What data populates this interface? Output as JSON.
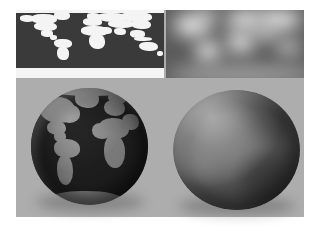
{
  "figure": {
    "background_color": "#ffffff",
    "plate_color": "#adadad",
    "panel_count": 4
  },
  "panels": [
    {
      "id": "world-map-texture",
      "position": "top-left",
      "label": "Sharp equirectangular world map texture",
      "ocean_color": "#3a3a3a",
      "land_color": "#f4f4f4",
      "projection": "equirectangular",
      "detail": "sharp"
    },
    {
      "id": "blurred-map-texture",
      "position": "top-right",
      "label": "Low-pass filtered (blurred) world map texture",
      "base_color": "#5b5b5b",
      "highlight_color": "#f2f2f2",
      "detail": "blurred"
    },
    {
      "id": "textured-globe",
      "position": "bottom-left",
      "label": "Sphere rendered with sharp map texture",
      "ocean_color": "#3a3a3a",
      "land_color": "#f2f2f2",
      "visible_region": "Americas, Atlantic Ocean, Africa, Europe"
    },
    {
      "id": "smooth-shaded-sphere",
      "position": "bottom-right",
      "label": "Sphere rendered with blurred map texture",
      "base_color": "#8f8f8f",
      "shading": "diffuse with upper-left light"
    }
  ],
  "map_geometry": {
    "landmasses": [
      {
        "name": "greenland",
        "x": 25.5,
        "y": 2,
        "w": 11,
        "h": 13
      },
      {
        "name": "arctic-ice-cap",
        "x": 0,
        "y": 0,
        "w": 100,
        "h": 4.5
      },
      {
        "name": "alaska",
        "x": 2.5,
        "y": 8,
        "w": 10,
        "h": 9
      },
      {
        "name": "canada",
        "x": 10,
        "y": 6,
        "w": 18,
        "h": 15
      },
      {
        "name": "north-america",
        "x": 12,
        "y": 17,
        "w": 16,
        "h": 14
      },
      {
        "name": "mexico",
        "x": 17,
        "y": 30,
        "w": 8,
        "h": 9
      },
      {
        "name": "central-america",
        "x": 23,
        "y": 37,
        "w": 5,
        "h": 7
      },
      {
        "name": "south-america-n",
        "x": 26,
        "y": 43,
        "w": 12,
        "h": 13
      },
      {
        "name": "south-america-s",
        "x": 28,
        "y": 54,
        "w": 7.5,
        "h": 20
      },
      {
        "name": "scandinavia",
        "x": 48,
        "y": 5,
        "w": 9,
        "h": 9
      },
      {
        "name": "europe",
        "x": 45,
        "y": 12,
        "w": 13,
        "h": 11
      },
      {
        "name": "africa-north",
        "x": 44,
        "y": 24,
        "w": 18,
        "h": 14
      },
      {
        "name": "africa-south",
        "x": 49,
        "y": 36,
        "w": 11,
        "h": 22
      },
      {
        "name": "arabia",
        "x": 57,
        "y": 25,
        "w": 8,
        "h": 11
      },
      {
        "name": "russia-west",
        "x": 55,
        "y": 4,
        "w": 20,
        "h": 14
      },
      {
        "name": "siberia",
        "x": 70,
        "y": 3,
        "w": 22,
        "h": 15
      },
      {
        "name": "central-asia",
        "x": 62,
        "y": 15,
        "w": 18,
        "h": 12
      },
      {
        "name": "india",
        "x": 66,
        "y": 26,
        "w": 8,
        "h": 11
      },
      {
        "name": "east-asia",
        "x": 78,
        "y": 14,
        "w": 13,
        "h": 14
      },
      {
        "name": "southeast-asia",
        "x": 77,
        "y": 30,
        "w": 10,
        "h": 11
      },
      {
        "name": "indonesia",
        "x": 80,
        "y": 40,
        "w": 12,
        "h": 6
      },
      {
        "name": "australia",
        "x": 83,
        "y": 47,
        "w": 13,
        "h": 14
      },
      {
        "name": "new-zealand",
        "x": 95,
        "y": 60,
        "w": 4,
        "h": 7
      },
      {
        "name": "antarctica",
        "x": 0,
        "y": 86,
        "w": 100,
        "h": 14
      }
    ]
  },
  "blur_blobs": [
    {
      "name": "arctic-band",
      "x": 0,
      "y": -6,
      "w": 110,
      "h": 20,
      "color": "#6e6e6e"
    },
    {
      "name": "north-america",
      "x": 6,
      "y": 8,
      "w": 26,
      "h": 30,
      "color": "#efefef"
    },
    {
      "name": "greenland",
      "x": 22,
      "y": 2,
      "w": 14,
      "h": 16,
      "color": "#e2e2e2"
    },
    {
      "name": "south-america",
      "x": 22,
      "y": 46,
      "w": 17,
      "h": 30,
      "color": "#f0f0f0"
    },
    {
      "name": "eurasia-west",
      "x": 44,
      "y": 2,
      "w": 26,
      "h": 26,
      "color": "#ededed"
    },
    {
      "name": "eurasia-east",
      "x": 66,
      "y": 2,
      "w": 32,
      "h": 26,
      "color": "#f4f4f4"
    },
    {
      "name": "africa",
      "x": 44,
      "y": 30,
      "w": 20,
      "h": 34,
      "color": "#dedede"
    },
    {
      "name": "india-asia",
      "x": 62,
      "y": 22,
      "w": 20,
      "h": 22,
      "color": "#c9c9c9"
    },
    {
      "name": "australia",
      "x": 80,
      "y": 44,
      "w": 18,
      "h": 22,
      "color": "#cfcfcf"
    },
    {
      "name": "antarctic-band",
      "x": 0,
      "y": 82,
      "w": 110,
      "h": 26,
      "color": "#a8a8a8"
    }
  ],
  "sphere_blobs": [
    {
      "name": "highlight-upper-left",
      "x": 8,
      "y": 6,
      "w": 50,
      "h": 46,
      "color": "#f0f0f0"
    },
    {
      "name": "highlight-left",
      "x": -4,
      "y": 40,
      "w": 44,
      "h": 40,
      "color": "#e8e8e8"
    },
    {
      "name": "mid-band",
      "x": 30,
      "y": 30,
      "w": 50,
      "h": 44,
      "color": "#c4c4c4"
    },
    {
      "name": "dark-lower-right",
      "x": 52,
      "y": 52,
      "w": 56,
      "h": 54,
      "color": "#6a6a6a"
    },
    {
      "name": "dark-upper-right",
      "x": 62,
      "y": 0,
      "w": 46,
      "h": 38,
      "color": "#7a7a7a"
    }
  ],
  "globe_geometry": {
    "landmasses": [
      {
        "name": "greenland",
        "x": 38,
        "y": 2,
        "w": 20,
        "h": 15
      },
      {
        "name": "arctic-cap",
        "x": 10,
        "y": -4,
        "w": 80,
        "h": 11
      },
      {
        "name": "north-america",
        "x": 8,
        "y": 8,
        "w": 30,
        "h": 22
      },
      {
        "name": "north-america-east",
        "x": 22,
        "y": 14,
        "w": 20,
        "h": 16
      },
      {
        "name": "mexico",
        "x": 14,
        "y": 28,
        "w": 16,
        "h": 12
      },
      {
        "name": "central-america",
        "x": 20,
        "y": 37,
        "w": 10,
        "h": 9
      },
      {
        "name": "south-america-n",
        "x": 20,
        "y": 44,
        "w": 22,
        "h": 16
      },
      {
        "name": "south-america-s",
        "x": 22,
        "y": 57,
        "w": 14,
        "h": 26
      },
      {
        "name": "europe",
        "x": 62,
        "y": 10,
        "w": 18,
        "h": 14
      },
      {
        "name": "scandinavia",
        "x": 66,
        "y": 3,
        "w": 16,
        "h": 11
      },
      {
        "name": "africa-north",
        "x": 58,
        "y": 26,
        "w": 26,
        "h": 18
      },
      {
        "name": "africa-south",
        "x": 62,
        "y": 40,
        "w": 18,
        "h": 28
      },
      {
        "name": "west-africa-bulge",
        "x": 52,
        "y": 30,
        "w": 16,
        "h": 14
      },
      {
        "name": "middle-east",
        "x": 78,
        "y": 22,
        "w": 14,
        "h": 14
      },
      {
        "name": "antarctic-edge",
        "x": 18,
        "y": 88,
        "w": 60,
        "h": 14
      }
    ]
  }
}
